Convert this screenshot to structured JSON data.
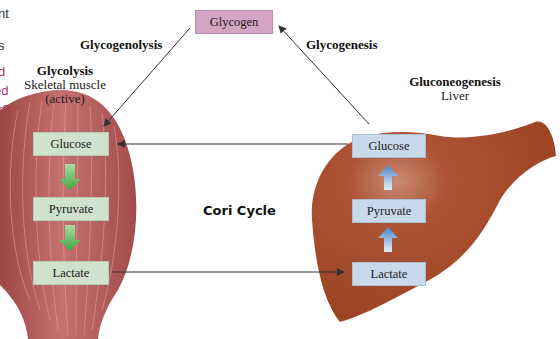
{
  "clipped_sidebar_text": {
    "lines_dark": [
      "nt",
      "",
      "s"
    ],
    "lines_accent": [
      "d",
      "rted",
      "r?"
    ]
  },
  "glycogen": {
    "label": "Glycogen",
    "color": "#d5a3c3"
  },
  "pathways": {
    "glycogenolysis": "Glycogenolysis",
    "glycogenesis": "Glycogenesis"
  },
  "muscle": {
    "process": "Glycolysis",
    "tissue_line1": "Skeletal muscle",
    "tissue_line2": "(active)",
    "color": "#b85a5a",
    "boxes": [
      "Glucose",
      "Pyruvate",
      "Lactate"
    ],
    "box_color": "#cfe3cc",
    "arrow_color": "#5cb85c"
  },
  "liver": {
    "process": "Gluconeogenesis",
    "tissue": "Liver",
    "color": "#a6482a",
    "boxes": [
      "Glucose",
      "Pyruvate",
      "Lactate"
    ],
    "box_color": "#c8d9ec",
    "arrow_color": "#5b8fc7"
  },
  "center_label": "Cori Cycle"
}
